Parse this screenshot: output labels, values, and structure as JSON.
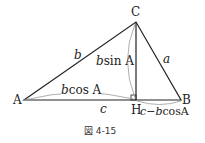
{
  "figure": {
    "caption": "図 4-15",
    "vertices": {
      "A": "A",
      "B": "B",
      "C": "C",
      "H": "H"
    },
    "sides": {
      "b": "b",
      "a": "a",
      "c": "c"
    },
    "annotations": {
      "height_var": "b",
      "height_fn": "sin A",
      "base_var": "b",
      "base_fn": "cos A",
      "remainder_c": "c",
      "remainder_rest": "−b",
      "remainder_fn": "cosA"
    },
    "colors": {
      "line": "#222222",
      "arc": "#888888"
    }
  }
}
